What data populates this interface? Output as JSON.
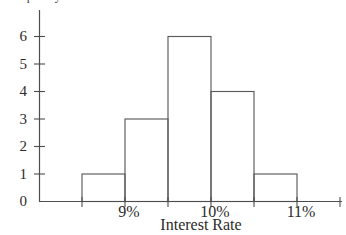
{
  "figure": {
    "background": "#ffffff",
    "axis_color": "#4d4d4d",
    "bar_outline_color": "#5a5a5a",
    "text_color": "#2b2b2b"
  },
  "chart_data": {
    "type": "bar",
    "subtype": "histogram",
    "title": "",
    "xlabel": "Interest Rate",
    "ylabel": "Frequency",
    "ylabel_clipped_at_top": true,
    "bin_edges_percent": [
      8.5,
      9.0,
      9.5,
      10.0,
      10.5,
      11.0,
      11.5
    ],
    "categories": [
      "8.5-9.0%",
      "9.0-9.5%",
      "9.5-10.0%",
      "10.0-10.5%",
      "10.5-11.0%"
    ],
    "values": [
      1,
      3,
      6,
      4,
      1
    ],
    "ylim": [
      0,
      6
    ],
    "y_ticks": [
      0,
      1,
      2,
      3,
      4,
      5,
      6
    ],
    "x_tick_labels": [
      {
        "value": 9,
        "label": "9%"
      },
      {
        "value": 10,
        "label": "10%"
      },
      {
        "value": 11,
        "label": "11%"
      }
    ],
    "grid": false,
    "legend": false,
    "bar_fill": "none"
  }
}
